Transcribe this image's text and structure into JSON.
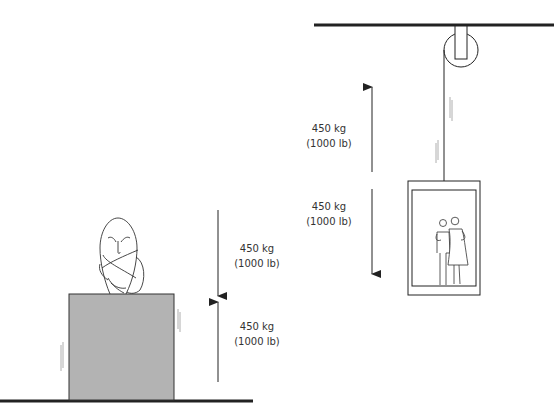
{
  "diagram": {
    "left_scene": {
      "description": "Statue bust resting on a grey crate on the floor",
      "force_down": {
        "mass": "450 kg",
        "weight": "(1000 lb)"
      },
      "force_up": {
        "mass": "450 kg",
        "weight": "(1000 lb)"
      }
    },
    "right_scene": {
      "description": "Elevator car with two people hanging from a pulley on the ceiling",
      "force_up": {
        "mass": "450 kg",
        "weight": "(1000 lb)"
      },
      "force_down": {
        "mass": "450 kg",
        "weight": "(1000 lb)"
      }
    },
    "colors": {
      "line": "#222222",
      "crate_fill": "#b3b3b3",
      "text": "#333333",
      "background": "#ffffff"
    }
  }
}
